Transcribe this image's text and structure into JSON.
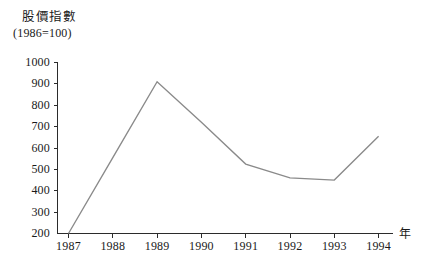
{
  "chart_data": {
    "type": "line",
    "title": "股價指數",
    "subtitle": "(1986=100)",
    "xlabel": "年",
    "ylabel": "",
    "categories": [
      "1987",
      "1988",
      "1989",
      "1990",
      "1991",
      "1992",
      "1993",
      "1994"
    ],
    "values": [
      200,
      555,
      910,
      720,
      525,
      460,
      450,
      655
    ],
    "series": [
      {
        "name": "股價指數",
        "values": [
          200,
          555,
          910,
          720,
          525,
          460,
          450,
          655
        ]
      }
    ],
    "ylim": [
      200,
      1000
    ],
    "ytick_labels": [
      "1000",
      "900",
      "800",
      "700",
      "600",
      "500",
      "400",
      "300",
      "200"
    ],
    "ytick_values": [
      1000,
      900,
      800,
      700,
      600,
      500,
      400,
      300,
      200
    ],
    "xtick_labels": [
      "1987",
      "1988",
      "1989",
      "1990",
      "1991",
      "1992",
      "1993",
      "1994"
    ],
    "grid": false,
    "legend": false,
    "line_color": "#8a8a8a",
    "axis_color": "#2b2b2b",
    "background_color": "#ffffff"
  }
}
